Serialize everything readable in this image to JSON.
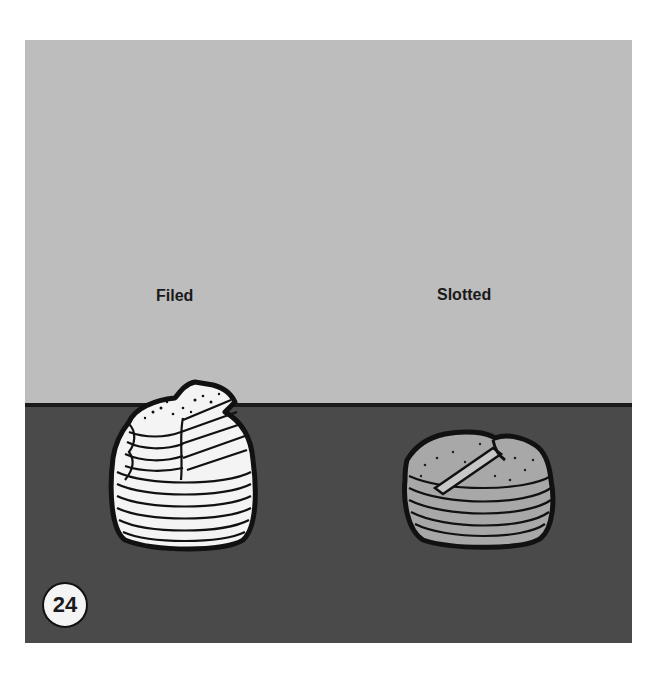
{
  "figure": {
    "number": "24",
    "labels": {
      "left": "Filed",
      "right": "Slotted"
    },
    "objects": [
      {
        "name": "filed-stack",
        "description": "white disc stack with filed/shaved top"
      },
      {
        "name": "slotted-stack",
        "description": "gray disc stack with slotted top"
      }
    ],
    "colors": {
      "background_top": "#bdbdbd",
      "background_bottom": "#4a4a4a",
      "filed_fill": "#f4f4f4",
      "slotted_fill": "#a8a8a8",
      "outline": "#111111"
    }
  }
}
